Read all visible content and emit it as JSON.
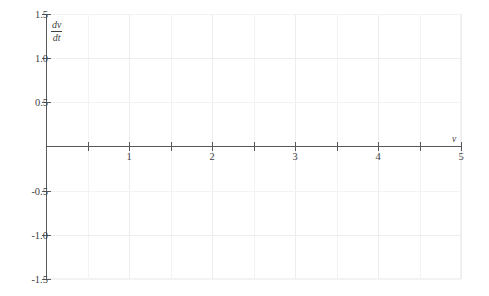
{
  "chart_data": {
    "type": "line",
    "title": "",
    "subtitle": "",
    "xlabel": "v",
    "ylabel": "dv/dt",
    "ylabel_numerator": "dv",
    "ylabel_denominator": "dt",
    "xlim": [
      0,
      5
    ],
    "ylim": [
      -1.5,
      1.5
    ],
    "grid": true,
    "legend": null,
    "x_ticks": [
      0,
      0.5,
      1,
      1.5,
      2,
      2.5,
      3,
      3.5,
      4,
      4.5,
      5
    ],
    "x_tick_labels": [
      "",
      "",
      "1",
      "",
      "2",
      "",
      "3",
      "",
      "4",
      "",
      "5"
    ],
    "x_major_ticks": [
      1,
      2,
      3,
      4,
      5
    ],
    "y_ticks": [
      -1.5,
      -1.0,
      -0.5,
      0,
      0.5,
      1.0,
      1.5
    ],
    "y_tick_labels": [
      "-1.5",
      "-1.0",
      "-0.5",
      "",
      "0.5",
      "1.0",
      "1.5"
    ],
    "series": [],
    "values": [],
    "annotations": [],
    "note": "Empty axes: no data curve is plotted."
  },
  "axes": {
    "x_axis_name": "v",
    "y_axis_name_numerator": "dv",
    "y_axis_name_denominator": "dt"
  },
  "colors": {
    "background": "#ffffff",
    "axis": "#58585c",
    "text": "#3f3f43",
    "grid_minor": "#f3f3f5",
    "grid_major": "#ededf0",
    "frame": "#f2f2f4"
  },
  "y_axis_labels": [
    {
      "text": "1.5",
      "value": 1.5
    },
    {
      "text": "1.0",
      "value": 1.0
    },
    {
      "text": "0.5",
      "value": 0.5
    },
    {
      "text": "-0.5",
      "value": -0.5
    },
    {
      "text": "-1.0",
      "value": -1.0
    },
    {
      "text": "-1.5",
      "value": -1.5
    }
  ],
  "x_axis_labels": [
    {
      "text": "1",
      "value": 1
    },
    {
      "text": "2",
      "value": 2
    },
    {
      "text": "3",
      "value": 3
    },
    {
      "text": "4",
      "value": 4
    },
    {
      "text": "5",
      "value": 5
    }
  ]
}
